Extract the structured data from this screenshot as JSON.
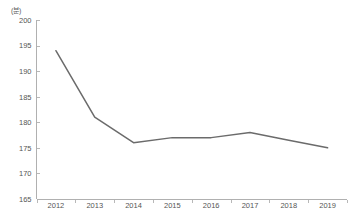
{
  "chart_data": {
    "type": "line",
    "title": "",
    "subtitle": "",
    "xlabel": "",
    "ylabel": "",
    "unit_label": "(분)",
    "categories": [
      "2012",
      "2013",
      "2014",
      "2015",
      "2016",
      "2017",
      "2018",
      "2019"
    ],
    "series": [
      {
        "name": "",
        "values": [
          194,
          181,
          176,
          177,
          177,
          178,
          176.5,
          175
        ]
      }
    ],
    "ylim": [
      165,
      200
    ],
    "ytick_values": [
      200,
      195,
      190,
      185,
      180,
      175,
      170,
      165
    ],
    "ytick_labels": [
      "200",
      "195",
      "190",
      "185",
      "180",
      "175",
      "170",
      "165"
    ],
    "grid": false,
    "legend": false,
    "legend_position": "none",
    "line_color": "#6b6b6b",
    "axis_color": "#b0b0b0",
    "text_color": "#555555",
    "background_color": "#ffffff"
  }
}
